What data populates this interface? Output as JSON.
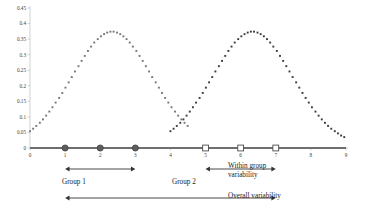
{
  "chart_data": {
    "type": "scatter",
    "title": "",
    "subtitle": "",
    "xlabel": "",
    "ylabel": "",
    "xlim": [
      0,
      9
    ],
    "ylim": [
      0,
      0.45
    ],
    "grid": false,
    "legend_position": "none",
    "y_ticks": [
      "0",
      "0.05",
      "0.1",
      "0.15",
      "0.2",
      "0.25",
      "0.3",
      "0.35",
      "0.4",
      "0.45"
    ],
    "y_tick_values": [
      0,
      0.05,
      0.1,
      0.15,
      0.2,
      0.25,
      0.3,
      0.35,
      0.4,
      0.45
    ],
    "x_ticks": [
      "0",
      "1",
      "2",
      "3",
      "4",
      "5",
      "6",
      "7",
      "8",
      "9"
    ],
    "x_tick_values": [
      0,
      1,
      2,
      3,
      4,
      5,
      6,
      7,
      8,
      9
    ],
    "series": [
      {
        "name": "Group 1 distribution",
        "marker": "square",
        "color": "#767676",
        "mean": 2,
        "sd": 1,
        "peak_value": 0.4,
        "peak_x": 2,
        "x": [
          0.0,
          0.09,
          0.18,
          0.28,
          0.37,
          0.46,
          0.55,
          0.64,
          0.73,
          0.83,
          0.92,
          1.01,
          1.1,
          1.19,
          1.28,
          1.38,
          1.47,
          1.56,
          1.65,
          1.74,
          1.83,
          1.93,
          2.02,
          2.11,
          2.2,
          2.29,
          2.38,
          2.48,
          2.57,
          2.66,
          2.75,
          2.84,
          2.93,
          3.03,
          3.12,
          3.21,
          3.3,
          3.39,
          3.48,
          3.58,
          3.67,
          3.76,
          3.85,
          3.94,
          4.03,
          4.13,
          4.22,
          4.31,
          4.4,
          4.49
        ],
        "y": [
          0.054,
          0.062,
          0.071,
          0.081,
          0.092,
          0.104,
          0.117,
          0.131,
          0.146,
          0.161,
          0.177,
          0.194,
          0.211,
          0.228,
          0.246,
          0.263,
          0.28,
          0.296,
          0.312,
          0.326,
          0.339,
          0.35,
          0.359,
          0.366,
          0.371,
          0.374,
          0.374,
          0.371,
          0.366,
          0.359,
          0.35,
          0.339,
          0.326,
          0.312,
          0.296,
          0.28,
          0.263,
          0.246,
          0.228,
          0.211,
          0.194,
          0.177,
          0.161,
          0.146,
          0.131,
          0.117,
          0.104,
          0.092,
          0.081,
          0.071
        ]
      },
      {
        "name": "Group 2 distribution",
        "marker": "square",
        "color": "#3b3b3b",
        "mean": 6,
        "sd": 1,
        "peak_value": 0.4,
        "peak_x": 6,
        "x": [
          4.0,
          4.09,
          4.18,
          4.28,
          4.37,
          4.46,
          4.55,
          4.64,
          4.73,
          4.83,
          4.92,
          5.01,
          5.1,
          5.19,
          5.28,
          5.38,
          5.47,
          5.56,
          5.65,
          5.74,
          5.83,
          5.93,
          6.02,
          6.11,
          6.2,
          6.29,
          6.38,
          6.48,
          6.57,
          6.66,
          6.75,
          6.84,
          6.93,
          7.03,
          7.12,
          7.21,
          7.3,
          7.39,
          7.48,
          7.58,
          7.67,
          7.76,
          7.85,
          7.94,
          8.03,
          8.13,
          8.22,
          8.31,
          8.4,
          8.49,
          8.58,
          8.68,
          8.77,
          8.86,
          8.95
        ],
        "y": [
          0.054,
          0.062,
          0.071,
          0.081,
          0.092,
          0.104,
          0.117,
          0.131,
          0.146,
          0.161,
          0.177,
          0.194,
          0.211,
          0.228,
          0.246,
          0.263,
          0.28,
          0.296,
          0.312,
          0.326,
          0.339,
          0.35,
          0.359,
          0.366,
          0.371,
          0.374,
          0.374,
          0.371,
          0.366,
          0.359,
          0.35,
          0.339,
          0.326,
          0.312,
          0.296,
          0.28,
          0.263,
          0.246,
          0.228,
          0.211,
          0.194,
          0.177,
          0.161,
          0.146,
          0.131,
          0.117,
          0.104,
          0.092,
          0.081,
          0.071,
          0.062,
          0.054,
          0.047,
          0.04,
          0.035
        ]
      }
    ],
    "baseline_points": [
      {
        "group": "Group 1",
        "marker": "filled-circle",
        "x": 1,
        "y": 0
      },
      {
        "group": "Group 1",
        "marker": "filled-circle",
        "x": 2,
        "y": 0
      },
      {
        "group": "Group 1",
        "marker": "filled-circle",
        "x": 3,
        "y": 0
      },
      {
        "group": "Group 2",
        "marker": "open-square",
        "x": 5,
        "y": 0
      },
      {
        "group": "Group 2",
        "marker": "open-square",
        "x": 6,
        "y": 0
      },
      {
        "group": "Group 2",
        "marker": "open-square",
        "x": 7,
        "y": 0
      }
    ],
    "annotations": [
      {
        "id": "group1-bracket",
        "label": "Group 1",
        "type": "double-arrow",
        "x_from": 1,
        "x_to": 3
      },
      {
        "id": "group2-bracket",
        "label": "Group 2",
        "type": "double-arrow",
        "x_from": 5,
        "x_to": 7
      },
      {
        "id": "within-group-label",
        "label": "Within group variability",
        "line1": "Within group",
        "line2": "variability",
        "type": "text"
      },
      {
        "id": "overall-bracket",
        "label": "Overall variability",
        "type": "double-arrow",
        "x_from": 1,
        "x_to": 7
      }
    ]
  },
  "labels": {
    "group1": "Group 1",
    "group2": "Group 2",
    "within_group_line1": "Within group",
    "within_group_line2": "variability",
    "overall": "Overall variability"
  },
  "colors": {
    "series1": "#767676",
    "series2": "#3b3b3b",
    "axis": "#bfbfbf",
    "baseline": "#6e6e6e",
    "arrow": "#333333",
    "text": "#1d1d1d"
  }
}
